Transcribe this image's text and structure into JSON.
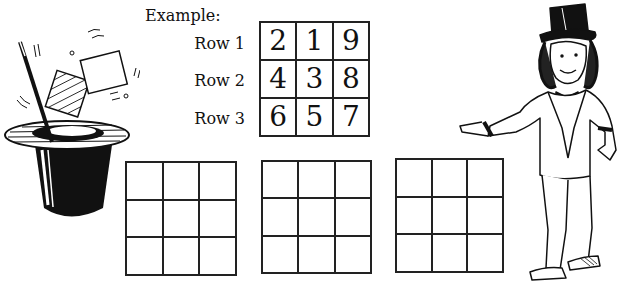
{
  "example": {
    "label": "Example:",
    "rows": [
      {
        "label": "Row 1",
        "values": [
          "2",
          "1",
          "9"
        ]
      },
      {
        "label": "Row 2",
        "values": [
          "4",
          "3",
          "8"
        ]
      },
      {
        "label": "Row 3",
        "values": [
          "6",
          "5",
          "7"
        ]
      }
    ]
  },
  "empty_grids": [
    {
      "id": "grid-1",
      "cells": [
        "",
        "",
        "",
        "",
        "",
        "",
        "",
        "",
        ""
      ]
    },
    {
      "id": "grid-2",
      "cells": [
        "",
        "",
        "",
        "",
        "",
        "",
        "",
        "",
        ""
      ]
    },
    {
      "id": "grid-3",
      "cells": [
        "",
        "",
        "",
        "",
        "",
        "",
        "",
        "",
        ""
      ]
    }
  ],
  "illustrations": {
    "left": "magic-hat-wand-cards-icon",
    "right": "magician-top-hat-tuxedo-icon"
  }
}
